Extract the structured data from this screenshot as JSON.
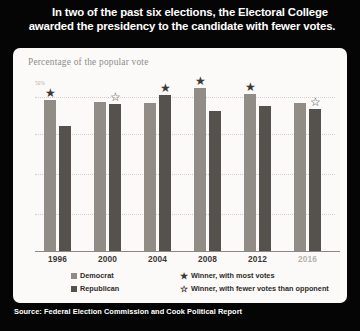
{
  "headline": {
    "line1": "In two of the past six elections, the Electoral College",
    "line2": "awarded the presidency to the candidate with fewer votes."
  },
  "subtitle": "Percentage of the popular vote",
  "source": "Source: Federal Election Commission and Cook Political Report",
  "legend": {
    "democrat": "Democrat",
    "republican": "Republican",
    "winner_most": "Winner, with most votes",
    "winner_fewer": "Winner, with fewer votes than opponent",
    "star_filled": "★",
    "star_hollow": "☆"
  },
  "colors": {
    "democrat": "#918c86",
    "republican": "#55524e",
    "card": "#fbfaf8",
    "poster": "#050505",
    "gridline": "#d9cfc9",
    "star": "#3b3835"
  },
  "chart_data": {
    "type": "bar",
    "title": "In two of the past six elections, the Electoral College awarded the presidency to the candidate with fewer votes.",
    "subtitle": "Percentage of the popular vote",
    "xlabel": "",
    "ylabel": "Percentage of the popular vote",
    "ylim": [
      0,
      55
    ],
    "ytick_labels": [
      "50%"
    ],
    "yticks": [
      50
    ],
    "grid": true,
    "legend_position": "bottom",
    "categories": [
      "1996",
      "2000",
      "2004",
      "2008",
      "2012",
      "2016"
    ],
    "series": [
      {
        "name": "Democrat",
        "color": "#918c86",
        "values": [
          49.2,
          48.4,
          48.3,
          52.9,
          51.1,
          48.2
        ]
      },
      {
        "name": "Republican",
        "color": "#55524e",
        "values": [
          40.7,
          47.9,
          50.7,
          45.7,
          47.2,
          46.1
        ]
      }
    ],
    "annotations": [
      {
        "year": "1996",
        "party": "Democrat",
        "marker": "star-filled",
        "meaning": "Winner, with most votes"
      },
      {
        "year": "2000",
        "party": "Republican",
        "marker": "star-hollow",
        "meaning": "Winner, with fewer votes than opponent"
      },
      {
        "year": "2004",
        "party": "Republican",
        "marker": "star-filled",
        "meaning": "Winner, with most votes"
      },
      {
        "year": "2008",
        "party": "Democrat",
        "marker": "star-filled",
        "meaning": "Winner, with most votes"
      },
      {
        "year": "2012",
        "party": "Democrat",
        "marker": "star-filled",
        "meaning": "Winner, with most votes"
      },
      {
        "year": "2016",
        "party": "Republican",
        "marker": "star-hollow",
        "meaning": "Winner, with fewer votes than opponent"
      }
    ]
  }
}
